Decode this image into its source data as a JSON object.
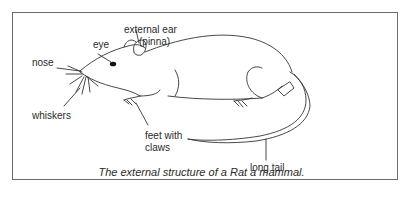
{
  "diagram": {
    "caption": "The external structure of a Rat a mammal.",
    "labels": {
      "eye": "eye",
      "external_ear_line1": "external ear",
      "external_ear_line2": "(pinna)",
      "nose": "nose",
      "whiskers": "whiskers",
      "feet_line1": "feet with",
      "feet_line2": "claws",
      "tail": "long tail"
    }
  }
}
